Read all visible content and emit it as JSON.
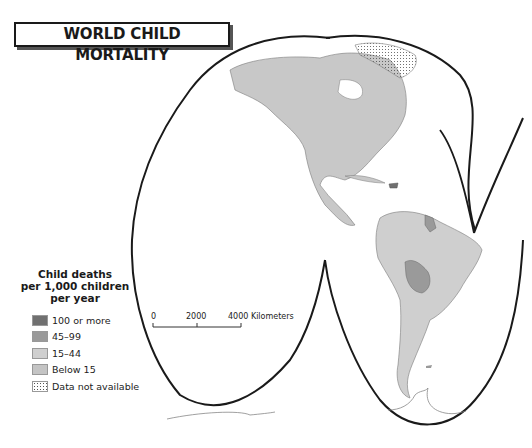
{
  "title": "WORLD CHILD MORTALITY",
  "legend": {
    "title_lines": [
      "Child deaths",
      "per 1,000 children",
      "per year"
    ],
    "items": [
      {
        "label": "100 or more",
        "color": "#707070",
        "pattern": "solid"
      },
      {
        "label": "45–99",
        "color": "#9a9a9a",
        "pattern": "solid"
      },
      {
        "label": "15–44",
        "color": "#cfcfcf",
        "pattern": "solid"
      },
      {
        "label": "Below 15",
        "color": "#c4c4c4",
        "pattern": "solid"
      },
      {
        "label": "Data not available",
        "color": "#ffffff",
        "pattern": "dots"
      }
    ]
  },
  "scale_bar": {
    "ticks": [
      "0",
      "2000",
      "4000 Kilometers"
    ]
  },
  "regions": [
    {
      "name": "North America",
      "category": "Below 15"
    },
    {
      "name": "Alaska",
      "category": "Below 15"
    },
    {
      "name": "Canadian Arctic Islands",
      "category": "Below 15"
    },
    {
      "name": "Greenland",
      "category": "Data not available"
    },
    {
      "name": "Mexico",
      "category": "15–44"
    },
    {
      "name": "Central America",
      "category": "15–44"
    },
    {
      "name": "Haiti",
      "category": "45–99"
    },
    {
      "name": "Guyana",
      "category": "45–99"
    },
    {
      "name": "Bolivia",
      "category": "45–99"
    },
    {
      "name": "South America",
      "category": "15–44"
    }
  ],
  "colors": {
    "land": "#c8c8c8",
    "border": "#7a7a7a",
    "outline": "#1a1a1a",
    "medium": "#9a9a9a"
  }
}
